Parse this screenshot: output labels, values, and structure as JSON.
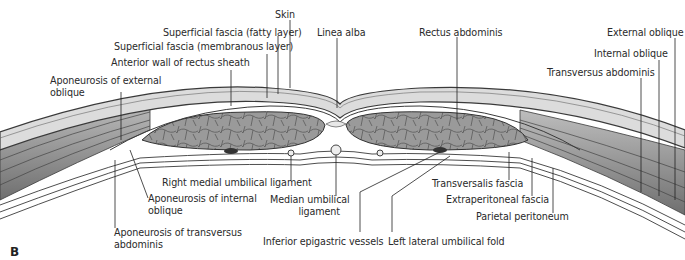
{
  "figure": {
    "panel_label": "B",
    "labels": {
      "skin": "Skin",
      "superficial_fascia_fatty": "Superficial fascia (fatty layer)",
      "superficial_fascia_membranous": "Superficial fascia (membranous layer)",
      "anterior_wall_rectus_sheath": "Anterior wall of rectus sheath",
      "aponeurosis_external_oblique_1": "Aponeurosis of external",
      "aponeurosis_external_oblique_2": "oblique",
      "linea_alba": "Linea alba",
      "rectus_abdominis": "Rectus abdominis",
      "external_oblique": "External oblique",
      "internal_oblique": "Internal oblique",
      "transversus_abdominis": "Transversus abdominis",
      "right_medial_umbilical_ligament": "Right medial umbilical ligament",
      "aponeurosis_internal_oblique_1": "Aponeurosis of internal",
      "aponeurosis_internal_oblique_2": "oblique",
      "median_umbilical_ligament_1": "Median umbilical",
      "median_umbilical_ligament_2": "ligament",
      "aponeurosis_transversus_1": "Aponeurosis of transversus",
      "aponeurosis_transversus_2": "abdominis",
      "inferior_epigastric_vessels": "Inferior epigastric vessels",
      "left_lateral_umbilical_fold": "Left lateral umbilical fold",
      "transversalis_fascia": "Transversalis fascia",
      "extraperitoneal_fascia": "Extraperitoneal fascia",
      "parietal_peritoneum": "Parietal peritoneum"
    },
    "colors": {
      "fat": "#d9d9d9",
      "muscle": "#8c8c8c",
      "outline": "#3a3a3a",
      "leader": "#222222"
    }
  }
}
